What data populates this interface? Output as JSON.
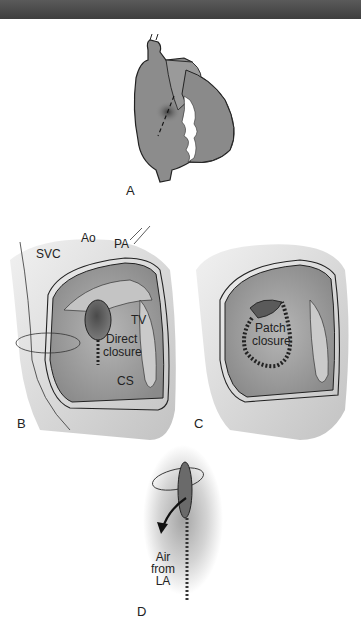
{
  "header": {
    "bar_color": "#4a4a4a"
  },
  "figure": {
    "panels": [
      {
        "id": "A",
        "label": "A",
        "description": "Heart anterior view with atriotomy incision line"
      },
      {
        "id": "B",
        "label": "B",
        "description": "Direct closure of atrial septal defect",
        "annotations": {
          "pa": "PA",
          "ao": "Ao",
          "svc": "SVC",
          "tv": "TV",
          "cs": "CS",
          "closure_line1": "Direct",
          "closure_line2": "closure"
        }
      },
      {
        "id": "C",
        "label": "C",
        "description": "Patch closure of atrial septal defect",
        "annotations": {
          "closure_line1": "Patch",
          "closure_line2": "closure"
        }
      },
      {
        "id": "D",
        "label": "D",
        "description": "Final suture tie with de-airing",
        "annotations": {
          "line1": "Air",
          "line2": "from",
          "line3": "LA"
        }
      }
    ]
  },
  "colors": {
    "tissue": "#a8a8a8",
    "tissue_dark": "#6e6e6e",
    "defect": "#5a5a5a",
    "outline": "#222222"
  }
}
